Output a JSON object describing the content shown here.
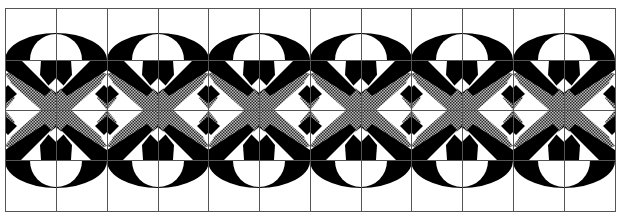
{
  "figure": {
    "motif_count": 6,
    "grid": {
      "columns": 12,
      "rows": 4
    },
    "colors": {
      "ink": "#000000",
      "paper": "#ffffff",
      "grid_line": "#555555",
      "hatch_dark": "#333333",
      "hatch_light": "#bdbdbd"
    }
  }
}
